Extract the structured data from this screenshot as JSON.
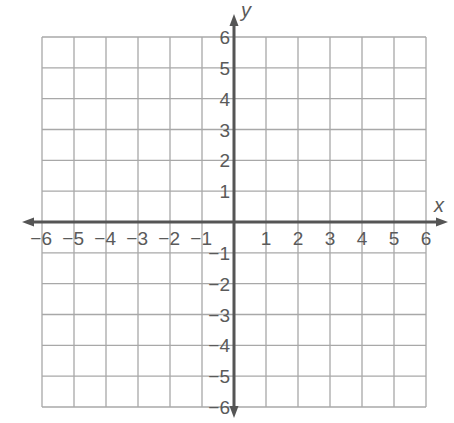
{
  "diagram": {
    "type": "coordinate-plane",
    "x_axis": {
      "label": "x",
      "min": -6,
      "max": 6,
      "step": 1
    },
    "y_axis": {
      "label": "y",
      "min": -6,
      "max": 6,
      "step": 1
    },
    "x_tick_labels": [
      "−6",
      "−5",
      "−4",
      "−3",
      "−2",
      "−1",
      "1",
      "2",
      "3",
      "4",
      "5",
      "6"
    ],
    "y_tick_labels": [
      "6",
      "5",
      "4",
      "3",
      "2",
      "1",
      "−1",
      "−2",
      "−3",
      "−4",
      "−5",
      "−6"
    ],
    "grid": true,
    "colors": {
      "grid": "#a8a8a8",
      "axis": "#555555",
      "text": "#5a5a5a"
    }
  }
}
